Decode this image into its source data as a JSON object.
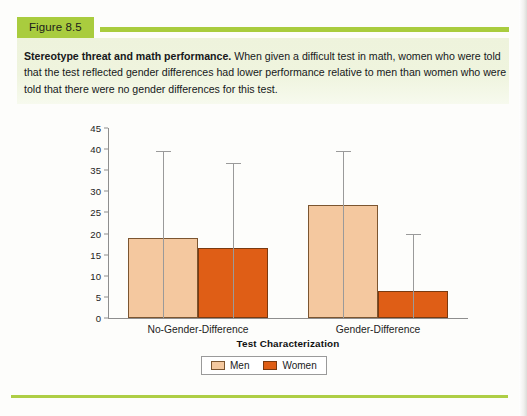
{
  "figure": {
    "tab_label": "Figure 8.5",
    "caption_lead": "Stereotype threat and math performance.",
    "caption_body": " When given a difficult test in math, women who were told that the test reflected gender differences had lower performance relative to men than women who were told that there were no gender differences for this test."
  },
  "colors": {
    "tab_green": "#a9cc3e",
    "rule_green": "#aece45",
    "caption_band": "#eef3dc",
    "men_fill": "#f4c89f",
    "women_fill": "#df5e16",
    "axis_gray": "#8e8e8e",
    "error_bar_gray": "#9a9a9a"
  },
  "chart_data": {
    "type": "bar",
    "title": "",
    "xlabel": "Test Characterization",
    "ylabel": "Score Corrected for Guessing",
    "ylim": [
      0,
      45
    ],
    "ytick_step": 5,
    "yticks": [
      0,
      5,
      10,
      15,
      20,
      25,
      30,
      35,
      40,
      45
    ],
    "ytick_labels": [
      "0",
      "5",
      "10",
      "15",
      "20",
      "25",
      "30",
      "35",
      "40",
      "45"
    ],
    "categories": [
      "No-Gender-Difference",
      "Gender-Difference"
    ],
    "grid": false,
    "legend_position": "bottom-center",
    "series": [
      {
        "name": "Men",
        "color": "#f4c89f",
        "values": [
          19.0,
          26.7
        ],
        "error_upper": [
          39.5,
          39.5
        ]
      },
      {
        "name": "Women",
        "color": "#df5e16",
        "values": [
          16.6,
          6.3
        ],
        "error_upper": [
          36.6,
          19.8
        ]
      }
    ]
  },
  "legend": {
    "items": [
      {
        "label": "Men",
        "swatch": "men"
      },
      {
        "label": "Women",
        "swatch": "women"
      }
    ]
  }
}
